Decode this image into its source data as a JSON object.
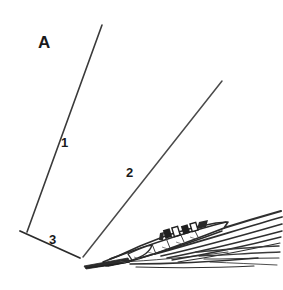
{
  "figure": {
    "panel_letter": "A",
    "background_color": "#ffffff",
    "ink_color": "#2b2b2b",
    "width": 283,
    "height": 290,
    "annotations": [
      {
        "id": "1",
        "label": "1",
        "name": "reference-line-1",
        "x": 61,
        "y": 136
      },
      {
        "id": "2",
        "label": "2",
        "name": "reference-line-2",
        "x": 126,
        "y": 166
      },
      {
        "id": "3",
        "label": "3",
        "name": "reference-line-3",
        "x": 49,
        "y": 233
      }
    ],
    "reference_lines": [
      {
        "id": "1",
        "x1": 102,
        "y1": 25,
        "x2": 27,
        "y2": 232,
        "stroke": "#3a3a3a",
        "width": 1.6
      },
      {
        "id": "2",
        "x1": 222,
        "y1": 81,
        "x2": 83,
        "y2": 257,
        "stroke": "#4a4a4a",
        "width": 1.5
      },
      {
        "id": "3",
        "x1": 20,
        "y1": 231,
        "x2": 80,
        "y2": 258,
        "stroke": "#2b2b2b",
        "width": 1.8
      }
    ],
    "vertex": {
      "x": 80,
      "y": 258
    }
  }
}
